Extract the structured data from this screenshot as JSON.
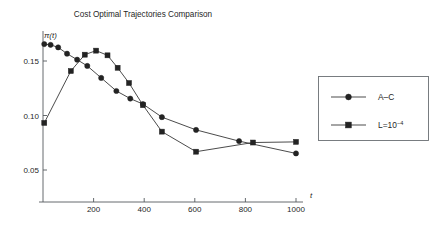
{
  "chart_data": {
    "type": "line",
    "title": "Cost Optimal Trajectories Comparison",
    "xlabel": "t",
    "ylabel": "π(t)",
    "xlim": [
      0,
      1050
    ],
    "ylim": [
      0.03,
      0.175
    ],
    "grid": false,
    "xticks": [
      200,
      400,
      600,
      800,
      1000
    ],
    "xtick_labels": [
      "200",
      "400",
      "600",
      "800",
      "1000"
    ],
    "yticks": [
      0.05,
      0.1,
      0.15
    ],
    "ytick_labels": [
      "0.05",
      "0.10",
      "0.15"
    ],
    "legend_position": "right-outside",
    "series": [
      {
        "name": "A–C",
        "marker": "circle",
        "x": [
          5,
          30,
          60,
          95,
          135,
          175,
          230,
          290,
          345,
          395,
          470,
          605,
          775,
          1000
        ],
        "y": [
          0.1655,
          0.1648,
          0.1625,
          0.1567,
          0.1512,
          0.1455,
          0.1345,
          0.1225,
          0.1155,
          0.1105,
          0.0985,
          0.0868,
          0.0765,
          0.0652
        ]
      },
      {
        "name": "L=10⁻⁴",
        "marker": "square",
        "x": [
          5,
          110,
          165,
          210,
          255,
          295,
          340,
          395,
          470,
          605,
          830,
          1000
        ],
        "y": [
          0.0932,
          0.1408,
          0.1558,
          0.1595,
          0.1552,
          0.1438,
          0.1298,
          0.1095,
          0.0852,
          0.0668,
          0.0752,
          0.0758
        ]
      }
    ],
    "legend": [
      {
        "label": "A–C",
        "marker": "circle"
      },
      {
        "label": "L=10",
        "exponent": "−4",
        "marker": "square"
      }
    ]
  }
}
